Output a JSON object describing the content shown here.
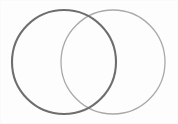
{
  "canvas": {
    "width": 178,
    "height": 124,
    "background_color": "#fdfdfd",
    "frame_border_color": "#fafafa",
    "title": "Two Overlapping Circles",
    "description": "Line drawing of two overlapping outlined circles forming a Venn-diagram shape"
  },
  "figure": {
    "kind": "venn-two-circle-outline",
    "shapes": [
      {
        "id": "left-circle",
        "name": "left-circle",
        "type": "circle",
        "cx": 64,
        "cy": 62,
        "r": 52,
        "stroke_color": "#6e6e6e",
        "stroke_width": 2.1,
        "fill": "none",
        "bounds": {
          "left": 12,
          "right": 116,
          "top": 10,
          "bottom": 114
        }
      },
      {
        "id": "right-circle",
        "name": "right-circle",
        "type": "circle",
        "cx": 113,
        "cy": 62,
        "r": 52,
        "stroke_color": "#a9a9a9",
        "stroke_width": 1.3,
        "fill": "none",
        "bounds": {
          "left": 61,
          "right": 165,
          "top": 10,
          "bottom": 114
        }
      }
    ],
    "intersections": [
      {
        "id": "upper-intersection",
        "x": 89,
        "y": 16
      },
      {
        "id": "lower-intersection",
        "x": 89,
        "y": 109
      }
    ],
    "overlap_region": {
      "id": "lens-overlap",
      "label": "",
      "fill": "none"
    }
  }
}
